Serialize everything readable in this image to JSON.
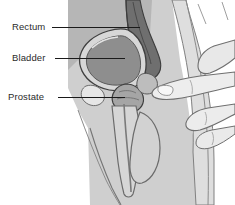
{
  "illustration": {
    "title": "Digital rectal examination - male pelvic sagittal cross-section",
    "style": "grayscale line drawing",
    "background_color": "#ffffff",
    "body_fill": "#c9c9c9",
    "skin_fill": "#d9d9d9",
    "hand_fill": "#ebebeb",
    "bladder_fill": "#8e8e8e",
    "rectum_fill": "#6f6f6f",
    "prostate_fill": "#a5a5a5",
    "outline_color": "#4a4a4a",
    "leader_color": "#1a1a1a"
  },
  "labels": [
    {
      "id": "rectum",
      "text": "Rectum"
    },
    {
      "id": "bladder",
      "text": "Bladder"
    },
    {
      "id": "prostate",
      "text": "Prostate"
    }
  ]
}
